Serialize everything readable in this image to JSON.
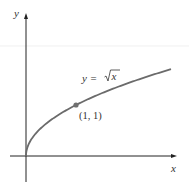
{
  "chart_data": {
    "type": "line",
    "title": "",
    "xlabel": "x",
    "ylabel": "y",
    "series": [
      {
        "name": "y = √x",
        "x": [
          0,
          0.25,
          0.5,
          1,
          1.5,
          2,
          2.5,
          2.9
        ],
        "values": [
          0,
          0.5,
          0.707,
          1,
          1.225,
          1.414,
          1.581,
          1.703
        ]
      }
    ],
    "annotations": [
      {
        "text": "y = √x",
        "at": [
          2.1,
          1.85
        ]
      },
      {
        "text": "(1, 1)",
        "point": [
          1,
          1
        ],
        "marked": true
      }
    ],
    "xlim": [
      -0.3,
      3.0
    ],
    "ylim": [
      -0.5,
      2.8
    ],
    "grid": false,
    "legend": "none",
    "colors": {
      "curve": "#6b6b6b",
      "point": "#707070",
      "axis": "#222222"
    }
  },
  "labels": {
    "y_axis": "y",
    "x_axis": "x",
    "equation_lhs": "y = ",
    "equation_rhs": "x",
    "point_label": "(1, 1)"
  }
}
